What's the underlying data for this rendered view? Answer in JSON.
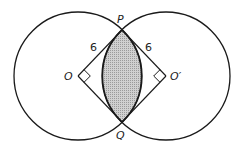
{
  "diagram": {
    "labels": {
      "P": "P",
      "Q": "Q",
      "O": "O",
      "O_prime": "O′",
      "radius_left": "6",
      "radius_right": "6"
    },
    "colors": {
      "stroke": "#1a1a1a",
      "shaded_region": "#bdbdbd",
      "background": "#ffffff"
    },
    "geometry": {
      "circle_left_center": [
        78,
        76
      ],
      "circle_right_center": [
        166,
        76
      ],
      "radius": 64,
      "P": [
        122,
        30
      ],
      "Q": [
        122,
        122
      ]
    }
  }
}
